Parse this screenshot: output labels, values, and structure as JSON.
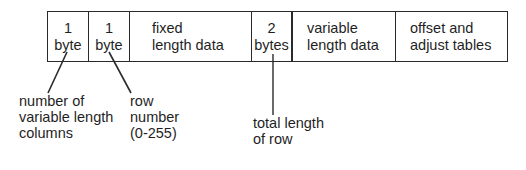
{
  "diagram": {
    "fields": [
      {
        "lines": [
          "1",
          "byte"
        ]
      },
      {
        "lines": [
          "1",
          "byte"
        ]
      },
      {
        "lines": [
          "fixed",
          "length data"
        ]
      },
      {
        "lines": [
          "2",
          "bytes"
        ]
      },
      {
        "lines": [
          "variable",
          "length data"
        ]
      },
      {
        "lines": [
          "offset and",
          "adjust tables"
        ]
      }
    ],
    "annotations": [
      {
        "target_field": 0,
        "lines": [
          "number of",
          "variable length",
          "columns"
        ]
      },
      {
        "target_field": 1,
        "lines": [
          "row",
          "number",
          "(0-255)"
        ]
      },
      {
        "target_field": 3,
        "lines": [
          "total length",
          "of row"
        ]
      }
    ],
    "colors": {
      "stroke": "#2a2a2a",
      "text": "#1f1f1f",
      "background": "#ffffff"
    }
  }
}
